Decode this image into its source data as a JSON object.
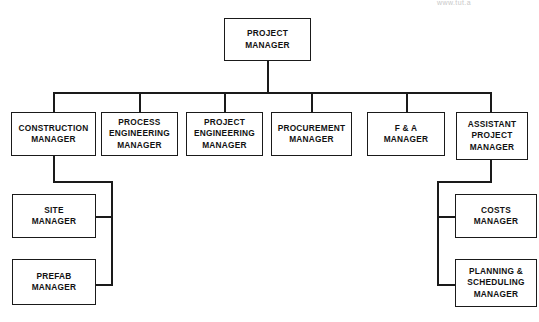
{
  "chart": {
    "type": "org-chart",
    "watermark": "www.tut.a",
    "line_color": "#1a1a1a",
    "box_fill": "#ffffff",
    "text_color": "#111111",
    "nodes": {
      "project_manager": {
        "label": "PROJECT\nMANAGER"
      },
      "construction_manager": {
        "label": "CONSTRUCTION\nMANAGER"
      },
      "process_engineering_manager": {
        "label": "PROCESS\nENGINEERING\nMANAGER"
      },
      "project_engineering_manager": {
        "label": "PROJECT\nENGINEERING\nMANAGER"
      },
      "procurement_manager": {
        "label": "PROCUREMENT\nMANAGER"
      },
      "fa_manager": {
        "label": "F & A\nMANAGER"
      },
      "assistant_project_manager": {
        "label": "ASSISTANT\nPROJECT\nMANAGER"
      },
      "site_manager": {
        "label": "SITE\nMANAGER"
      },
      "prefab_manager": {
        "label": "PREFAB\nMANAGER"
      },
      "costs_manager": {
        "label": "COSTS\nMANAGER"
      },
      "planning_scheduling_manager": {
        "label": "PLANNING &\nSCHEDULING\nMANAGER"
      }
    },
    "hierarchy": {
      "root": "project_manager",
      "level_two": [
        "construction_manager",
        "process_engineering_manager",
        "project_engineering_manager",
        "procurement_manager",
        "fa_manager",
        "assistant_project_manager"
      ],
      "construction_manager_children": [
        "site_manager",
        "prefab_manager"
      ],
      "assistant_project_manager_children": [
        "costs_manager",
        "planning_scheduling_manager"
      ]
    }
  }
}
